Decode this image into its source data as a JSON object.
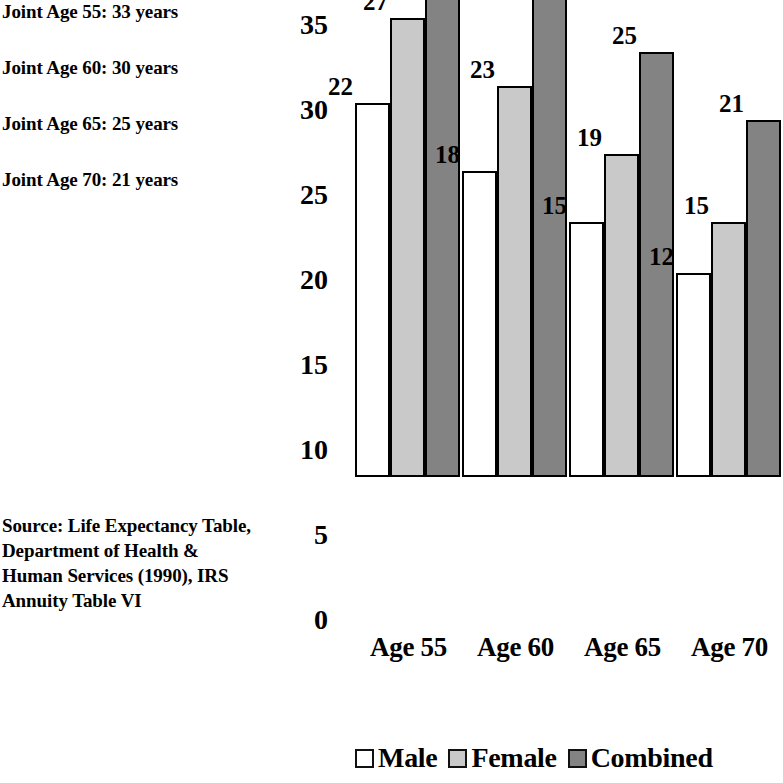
{
  "annotations": {
    "joint_notes": [
      "Joint Age 55: 33 years",
      "Joint Age 60: 30 years",
      "Joint Age 65: 25 years",
      "Joint Age 70: 21 years"
    ],
    "source": "Source: Life Expectancy Table, Department of Health & Human Services (1990), IRS Annuity Table VI"
  },
  "colors": {
    "male": "#ffffff",
    "female": "#c9c9c9",
    "combined": "#838383",
    "outline": "#000000"
  },
  "chart_data": {
    "type": "bar",
    "title": "",
    "xlabel": "",
    "ylabel": "",
    "ylim": [
      0,
      35
    ],
    "yticks": [
      35,
      30,
      25,
      20,
      15,
      10,
      5,
      0
    ],
    "grid": false,
    "legend_position": "bottom",
    "categories": [
      "Age 55",
      "Age 60",
      "Age 65",
      "Age 70"
    ],
    "series": [
      {
        "name": "Male",
        "values": [
          22,
          18,
          15,
          12
        ]
      },
      {
        "name": "Female",
        "values": [
          27,
          23,
          19,
          15
        ]
      },
      {
        "name": "Combined",
        "values": [
          33,
          30,
          25,
          21
        ]
      }
    ]
  }
}
